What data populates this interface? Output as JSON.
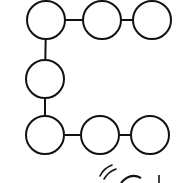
{
  "diagram": {
    "title": "",
    "stroke_color": "#111111",
    "fill_color": "#ffffff",
    "stroke_width": 2,
    "node_radius": 19,
    "nodes": [
      {
        "id": "n1",
        "cx": 46,
        "cy": 20
      },
      {
        "id": "n2",
        "cx": 102,
        "cy": 20
      },
      {
        "id": "n3",
        "cx": 152,
        "cy": 20
      },
      {
        "id": "n4",
        "cx": 45,
        "cy": 79
      },
      {
        "id": "n5",
        "cx": 45,
        "cy": 135
      },
      {
        "id": "n6",
        "cx": 100,
        "cy": 135
      },
      {
        "id": "n7",
        "cx": 150,
        "cy": 135
      }
    ],
    "edges": [
      {
        "from": "n1",
        "to": "n2"
      },
      {
        "from": "n2",
        "to": "n3"
      },
      {
        "from": "n1",
        "to": "n4"
      },
      {
        "from": "n4",
        "to": "n5"
      },
      {
        "from": "n5",
        "to": "n6"
      },
      {
        "from": "n6",
        "to": "n7"
      }
    ],
    "cropped_fragment": {
      "description": "partial strokes of another figure at bottom edge: two curved motion arcs, top of a circle, small vertical stroke",
      "arcs": [
        {
          "d": "M 100 176 Q 104 168 112 165"
        },
        {
          "d": "M 104 179 Q 108 172 116 169"
        }
      ],
      "circle_top": {
        "d": "M 121 183 Q 130 172 141 178"
      },
      "tick": {
        "x1": 159,
        "y1": 175,
        "x2": 159,
        "y2": 183
      }
    }
  }
}
